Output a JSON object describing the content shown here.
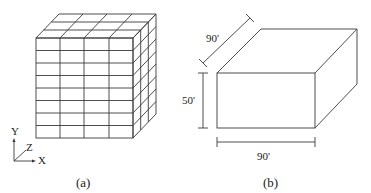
{
  "figure_a": {
    "caption": "(a)",
    "mesh": {
      "columns": 4,
      "rows": 8,
      "depth_divisions": 3
    },
    "axes": {
      "y_label": "Y",
      "z_label": "Z",
      "x_label": "X"
    }
  },
  "figure_b": {
    "caption": "(b)",
    "dimensions": {
      "depth": "90'",
      "height": "50'",
      "width": "90'"
    }
  }
}
